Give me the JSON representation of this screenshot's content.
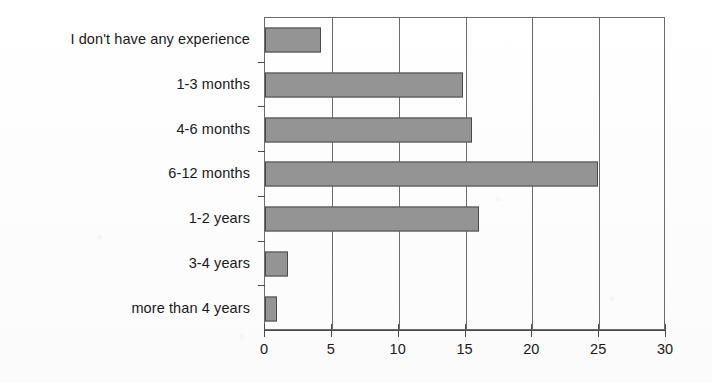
{
  "chart_data": {
    "type": "bar",
    "orientation": "horizontal",
    "title": "",
    "subtitle": "",
    "xlabel": "",
    "ylabel": "",
    "categories": [
      "I don't have any experience",
      "1-3 months",
      "4-6 months",
      "6-12 months",
      "1-2 years",
      "3-4 years",
      "more than 4 years"
    ],
    "values": [
      4.2,
      14.8,
      15.5,
      24.9,
      16.0,
      1.7,
      0.9
    ],
    "series": [
      {
        "name": "",
        "values": [
          4.2,
          14.8,
          15.5,
          24.9,
          16.0,
          1.7,
          0.9
        ]
      }
    ],
    "xlim": [
      0,
      30
    ],
    "xticks": [
      0,
      5,
      10,
      15,
      20,
      25,
      30
    ],
    "xtick_labels": [
      "0",
      "5",
      "10",
      "15",
      "20",
      "25",
      "30"
    ],
    "grid": true,
    "grid_axis": "x",
    "legend": false,
    "legend_position": "none",
    "bar_color": "#949494",
    "bar_edge_color": "#4a4a4a",
    "axis_color": "#6b6b6b",
    "background_color": "#ffffff"
  }
}
